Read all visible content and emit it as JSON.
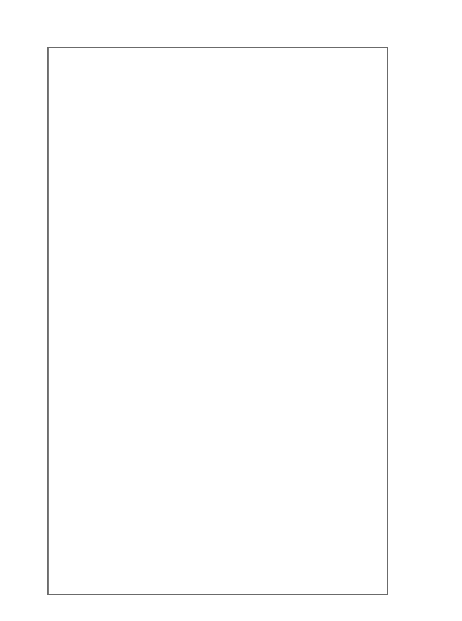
{
  "chart_data": {
    "type": "scatter",
    "subtype": "forest-plot",
    "xlabel": "",
    "ylabel": "",
    "xlim": [
      -7.0,
      7.0
    ],
    "xticks": [
      -6,
      -4,
      -2,
      0,
      2,
      4,
      6
    ],
    "xticklabels": [
      "-6",
      "-4",
      "-2",
      "0",
      "2",
      "4",
      "6"
    ],
    "grid": false,
    "legend": null,
    "reference_line": 0,
    "regions": [
      "northwest",
      "southwest",
      "southcal",
      "uppermidwest",
      "industmidwest",
      "northeast",
      "southeast"
    ],
    "point_label": "estimate",
    "interval_label": "95% confidence interval",
    "rows": [
      {
        "label": "seat",
        "region": "northwest",
        "estimate": 0.55,
        "low": -0.75,
        "high": 1.85,
        "overall": false
      },
      {
        "label": "sanj",
        "region": "northwest",
        "estimate": 0.05,
        "low": -1.25,
        "high": 1.4,
        "overall": false
      },
      {
        "label": "oakl",
        "region": "northwest",
        "estimate": 1.45,
        "low": -0.1,
        "high": 3.35,
        "overall": false
      },
      {
        "label": "sacr",
        "region": "northwest",
        "estimate": 0.85,
        "low": -0.25,
        "high": 1.95,
        "overall": false
      },
      {
        "label": "salt",
        "region": "northwest",
        "estimate": -1.2,
        "low": -2.8,
        "high": 0.35,
        "overall": false
      },
      {
        "label": "taco",
        "region": "northwest",
        "estimate": -0.85,
        "low": -2.1,
        "high": 0.4,
        "overall": false
      },
      {
        "label": "stoc",
        "region": "northwest",
        "estimate": 1.1,
        "low": -0.45,
        "high": 2.8,
        "overall": false
      },
      {
        "label": "colo",
        "region": "northwest",
        "estimate": -1.6,
        "low": -3.3,
        "high": 0.35,
        "overall": false
      },
      {
        "label": "mode",
        "region": "northwest",
        "estimate": 2.7,
        "low": -0.7,
        "high": 6.9,
        "overall": false
      },
      {
        "label": "spok",
        "region": "northwest",
        "estimate": -1.95,
        "low": -4.4,
        "high": 0.35,
        "overall": false
      },
      {
        "label": "olym",
        "region": "northwest",
        "estimate": 0.05,
        "low": -0.75,
        "high": 0.85,
        "overall": false
      },
      {
        "label": "overall",
        "region": "northwest",
        "estimate": 0.1,
        "low": -0.45,
        "high": 0.65,
        "overall": true
      },
      {
        "label": "phoe",
        "region": "southwest",
        "estimate": 0.35,
        "low": -0.55,
        "high": 1.3,
        "overall": false
      },
      {
        "label": "sana",
        "region": "southwest",
        "estimate": 0.95,
        "low": -0.55,
        "high": 2.4,
        "overall": false
      },
      {
        "label": "okla",
        "region": "southwest",
        "estimate": 0.5,
        "low": -1.2,
        "high": 2.2,
        "overall": false
      },
      {
        "label": "elpa",
        "region": "southwest",
        "estimate": 0.8,
        "low": -1.2,
        "high": 2.75,
        "overall": false
      },
      {
        "label": "aust",
        "region": "southwest",
        "estimate": 0.95,
        "low": -1.3,
        "high": 3.05,
        "overall": false
      },
      {
        "label": "albu",
        "region": "southwest",
        "estimate": 0.15,
        "low": -1.9,
        "high": 2.15,
        "overall": false
      },
      {
        "label": "corp",
        "region": "southwest",
        "estimate": -0.3,
        "low": -2.45,
        "high": 1.85,
        "overall": false
      },
      {
        "label": "lubb",
        "region": "southwest",
        "estimate": -1.35,
        "low": -3.55,
        "high": 0.9,
        "overall": false
      },
      {
        "label": "overall",
        "region": "southwest",
        "estimate": 0.45,
        "low": -0.2,
        "high": 1.1,
        "overall": true
      },
      {
        "label": "la",
        "region": "southcal",
        "estimate": 0.15,
        "low": -0.35,
        "high": 0.65,
        "overall": false
      },
      {
        "label": "sand",
        "region": "southcal",
        "estimate": 0.2,
        "low": -0.7,
        "high": 1.1,
        "overall": false
      },
      {
        "label": "staa",
        "region": "southcal",
        "estimate": 0.6,
        "low": -0.4,
        "high": 1.65,
        "overall": false
      },
      {
        "label": "sanb",
        "region": "southcal",
        "estimate": 0.55,
        "low": -0.5,
        "high": 1.6,
        "overall": false
      },
      {
        "label": "riva",
        "region": "southcal",
        "estimate": 0.3,
        "low": -0.55,
        "high": 1.15,
        "overall": false
      },
      {
        "label": "fres",
        "region": "southcal",
        "estimate": 0.4,
        "low": -0.85,
        "high": 1.7,
        "overall": false
      },
      {
        "label": "bake",
        "region": "southcal",
        "estimate": -0.25,
        "low": -1.55,
        "high": 1.05,
        "overall": false
      },
      {
        "label": "overall",
        "region": "southcal",
        "estimate": 0.25,
        "low": -0.25,
        "high": 0.75,
        "overall": true
      },
      {
        "label": "minn",
        "region": "uppermidwest",
        "estimate": 0.1,
        "low": -0.95,
        "high": 1.15,
        "overall": false
      },
      {
        "label": "kan",
        "region": "uppermidwest",
        "estimate": -0.35,
        "low": -1.8,
        "high": 1.1,
        "overall": false
      },
      {
        "label": "wich",
        "region": "uppermidwest",
        "estimate": -1.7,
        "low": -3.45,
        "high": 0.1,
        "overall": false
      },
      {
        "label": "desm",
        "region": "uppermidwest",
        "estimate": -0.55,
        "low": -2.35,
        "high": 1.3,
        "overall": false
      },
      {
        "label": "kans",
        "region": "uppermidwest",
        "estimate": 0.35,
        "low": -1.45,
        "high": 2.1,
        "overall": false
      },
      {
        "label": "tope",
        "region": "uppermidwest",
        "estimate": 0.9,
        "low": -1.85,
        "high": 3.7,
        "overall": false
      },
      {
        "label": "overall",
        "region": "uppermidwest",
        "estimate": -0.1,
        "low": -0.75,
        "high": 0.6,
        "overall": true
      },
      {
        "label": "chic",
        "region": "industmidwest",
        "estimate": 0.35,
        "low": -0.15,
        "high": 0.85,
        "overall": false
      },
      {
        "label": "det",
        "region": "industmidwest",
        "estimate": 0.45,
        "low": -0.3,
        "high": 1.2,
        "overall": false
      },
      {
        "label": "clev",
        "region": "industmidwest",
        "estimate": 0.25,
        "low": -0.55,
        "high": 1.05,
        "overall": false
      },
      {
        "label": "pitt",
        "region": "industmidwest",
        "estimate": 0.3,
        "low": -0.55,
        "high": 1.15,
        "overall": false
      },
      {
        "label": "stlo",
        "region": "industmidwest",
        "estimate": 0.55,
        "low": -0.4,
        "high": 1.55,
        "overall": false
      },
      {
        "label": "buff",
        "region": "industmidwest",
        "estimate": -0.2,
        "low": -1.45,
        "high": 1.05,
        "overall": false
      },
      {
        "label": "clmo",
        "region": "industmidwest",
        "estimate": 0.65,
        "low": -0.75,
        "high": 2.1,
        "overall": false
      },
      {
        "label": "cinc",
        "region": "industmidwest",
        "estimate": 0.2,
        "low": -1.05,
        "high": 1.45,
        "overall": false
      },
      {
        "label": "indi",
        "region": "industmidwest",
        "estimate": 0.3,
        "low": -1.05,
        "high": 1.7,
        "overall": false
      },
      {
        "label": "loui",
        "region": "industmidwest",
        "estimate": 0.05,
        "low": -1.4,
        "high": 1.5,
        "overall": false
      },
      {
        "label": "dayt",
        "region": "industmidwest",
        "estimate": 0.5,
        "low": -1.2,
        "high": 2.25,
        "overall": false
      },
      {
        "label": "akr",
        "region": "industmidwest",
        "estimate": -0.95,
        "low": -2.75,
        "high": 0.85,
        "overall": false
      },
      {
        "label": "gdrp",
        "region": "industmidwest",
        "estimate": 0.45,
        "low": -1.5,
        "high": 2.45,
        "overall": false
      },
      {
        "label": "tole",
        "region": "industmidwest",
        "estimate": 0.6,
        "low": -1.35,
        "high": 2.6,
        "overall": false
      },
      {
        "label": "madi",
        "region": "industmidwest",
        "estimate": 2.55,
        "low": -0.45,
        "high": 5.65,
        "overall": false
      },
      {
        "label": "ftwa",
        "region": "industmidwest",
        "estimate": 0.1,
        "low": -2.05,
        "high": 2.25,
        "overall": false
      },
      {
        "label": "lex",
        "region": "industmidwest",
        "estimate": 0.35,
        "low": -3.85,
        "high": 4.6,
        "overall": false
      },
      {
        "label": "evan",
        "region": "industmidwest",
        "estimate": -0.7,
        "low": -2.6,
        "high": 1.2,
        "overall": false
      },
      {
        "label": "overall",
        "region": "industmidwest",
        "estimate": 0.3,
        "low": -0.1,
        "high": 0.7,
        "overall": true
      },
      {
        "label": "ny",
        "region": "northeast",
        "estimate": 0.6,
        "low": 0.05,
        "high": 1.15,
        "overall": false
      },
      {
        "label": "phil",
        "region": "northeast",
        "estimate": 0.4,
        "low": -0.25,
        "high": 1.05,
        "overall": false
      },
      {
        "label": "nwk",
        "region": "northeast",
        "estimate": 0.85,
        "low": -0.05,
        "high": 1.8,
        "overall": false
      },
      {
        "label": "balt",
        "region": "northeast",
        "estimate": 0.7,
        "low": -0.25,
        "high": 1.7,
        "overall": false
      },
      {
        "label": "roch",
        "region": "northeast",
        "estimate": 0.95,
        "low": -0.4,
        "high": 2.35,
        "overall": false
      },
      {
        "label": "worc",
        "region": "northeast",
        "estimate": 0.3,
        "low": -1.0,
        "high": 1.65,
        "overall": false
      },
      {
        "label": "bost",
        "region": "northeast",
        "estimate": 0.5,
        "low": -0.2,
        "high": 1.25,
        "overall": false
      },
      {
        "label": "dc",
        "region": "northeast",
        "estimate": 0.8,
        "low": -0.3,
        "high": 1.9,
        "overall": false
      },
      {
        "label": "prov",
        "region": "northeast",
        "estimate": 0.85,
        "low": -0.6,
        "high": 2.3,
        "overall": false
      },
      {
        "label": "jers",
        "region": "northeast",
        "estimate": 0.75,
        "low": -0.85,
        "high": 2.35,
        "overall": false
      },
      {
        "label": "syra",
        "region": "northeast",
        "estimate": 0.7,
        "low": -1.0,
        "high": 2.45,
        "overall": false
      },
      {
        "label": "nor",
        "region": "northeast",
        "estimate": 0.65,
        "low": -1.15,
        "high": 2.45,
        "overall": false
      },
      {
        "label": "rich",
        "region": "northeast",
        "estimate": 0.35,
        "low": -1.35,
        "high": 2.1,
        "overall": false
      },
      {
        "label": "arlv",
        "region": "northeast",
        "estimate": 0.2,
        "low": -1.7,
        "high": 2.1,
        "overall": false
      },
      {
        "label": "king",
        "region": "northeast",
        "estimate": 0.45,
        "low": -1.55,
        "high": 2.45,
        "overall": false
      },
      {
        "label": "overall",
        "region": "northeast",
        "estimate": 0.55,
        "low": 0.1,
        "high": 1.0,
        "overall": true
      },
      {
        "label": "dlft",
        "region": "southeast",
        "estimate": 0.15,
        "low": -0.75,
        "high": 1.05,
        "overall": false
      },
      {
        "label": "hous",
        "region": "southeast",
        "estimate": 0.35,
        "low": -0.55,
        "high": 1.25,
        "overall": false
      },
      {
        "label": "miam",
        "region": "southeast",
        "estimate": 0.6,
        "low": -0.45,
        "high": 1.65,
        "overall": false
      },
      {
        "label": "atla",
        "region": "southeast",
        "estimate": 0.5,
        "low": -0.6,
        "high": 1.6,
        "overall": false
      },
      {
        "label": "stpe",
        "region": "southeast",
        "estimate": 0.25,
        "low": -1.05,
        "high": 1.55,
        "overall": false
      },
      {
        "label": "tamp",
        "region": "southeast",
        "estimate": 0.8,
        "low": -0.65,
        "high": 2.3,
        "overall": false
      },
      {
        "label": "memp",
        "region": "southeast",
        "estimate": 0.45,
        "low": -1.05,
        "high": 1.95,
        "overall": false
      },
      {
        "label": "orla",
        "region": "southeast",
        "estimate": -0.15,
        "low": -1.75,
        "high": 1.45,
        "overall": false
      },
      {
        "label": "jckv",
        "region": "southeast",
        "estimate": 0.55,
        "low": -1.05,
        "high": 2.2,
        "overall": false
      },
      {
        "label": "birm",
        "region": "southeast",
        "estimate": 0.3,
        "low": -1.35,
        "high": 2.0,
        "overall": false
      },
      {
        "label": "char",
        "region": "southeast",
        "estimate": 0.95,
        "low": -1.05,
        "high": 3.0,
        "overall": false
      },
      {
        "label": "nash",
        "region": "southeast",
        "estimate": 1.55,
        "low": -1.85,
        "high": 5.0,
        "overall": false
      },
      {
        "label": "tuls",
        "region": "southeast",
        "estimate": 0.4,
        "low": -1.6,
        "high": 2.4,
        "overall": false
      },
      {
        "label": "no",
        "region": "southeast",
        "estimate": -0.3,
        "low": -2.35,
        "high": 1.75,
        "overall": false
      },
      {
        "label": "ral",
        "region": "southeast",
        "estimate": 0.1,
        "low": -2.1,
        "high": 2.35,
        "overall": false
      },
      {
        "label": "batr",
        "region": "southeast",
        "estimate": -0.75,
        "low": -3.05,
        "high": 1.55,
        "overall": false
      },
      {
        "label": "lrk",
        "region": "southeast",
        "estimate": -2.6,
        "low": -4.95,
        "high": -0.2,
        "overall": false
      },
      {
        "label": "grnb",
        "region": "southeast",
        "estimate": 0.2,
        "low": -2.25,
        "high": 2.7,
        "overall": false
      },
      {
        "label": "knox",
        "region": "southeast",
        "estimate": -1.85,
        "low": -4.4,
        "high": 0.7,
        "overall": false
      },
      {
        "label": "shre",
        "region": "southeast",
        "estimate": 0.45,
        "low": -2.3,
        "high": 3.2,
        "overall": false
      },
      {
        "label": "cks",
        "region": "southeast",
        "estimate": 0.7,
        "low": -2.2,
        "high": 3.6,
        "overall": false
      },
      {
        "label": "hunt",
        "region": "southeast",
        "estimate": 1.1,
        "low": -1.95,
        "high": 4.25,
        "overall": false
      },
      {
        "label": "overall",
        "region": "southeast",
        "estimate": 0.3,
        "low": -0.25,
        "high": 0.85,
        "overall": true
      },
      {
        "label": "overall",
        "region": "",
        "estimate": 0.35,
        "low": 0.1,
        "high": 0.6,
        "overall": true
      }
    ]
  },
  "colors": {
    "point_stroke": "#7d7d88",
    "interval": "#9a9aa2",
    "overall_marker": "#2a2a2a",
    "axis": "#6b6b6b",
    "zero_line": "#7a7a7a",
    "text": "#111111"
  }
}
